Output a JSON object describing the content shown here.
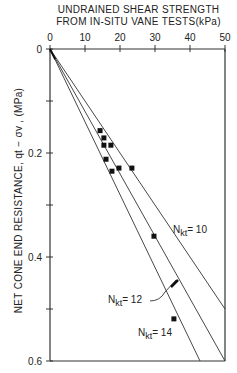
{
  "chart_data": {
    "type": "scatter",
    "title_lines": [
      "UNDRAINED SHEAR STRENGTH",
      "FROM IN-SITU VANE TESTS(kPa)"
    ],
    "xlabel": "UNDRAINED SHEAR STRENGTH FROM IN-SITU VANE TESTS(kPa)",
    "ylabel": "NET CONE END RESISTANCE, qt − σv , (MPa)",
    "x_axis_position": "top",
    "y_inverted": true,
    "xlim": [
      0,
      50
    ],
    "ylim": [
      0,
      0.6
    ],
    "x_ticks": [
      0,
      10,
      20,
      30,
      40,
      50
    ],
    "y_ticks": [
      0,
      0.2,
      0.4,
      0.6
    ],
    "y_tick_labels": [
      "0",
      "0.2",
      "0.4",
      "0.6"
    ],
    "grid": false,
    "series": [
      {
        "name": "Vane test data",
        "type": "scatter",
        "marker": "square",
        "points": [
          {
            "x": 14.3,
            "y": 0.157
          },
          {
            "x": 15.4,
            "y": 0.171
          },
          {
            "x": 15.4,
            "y": 0.185
          },
          {
            "x": 17.4,
            "y": 0.185
          },
          {
            "x": 16.0,
            "y": 0.212
          },
          {
            "x": 17.7,
            "y": 0.235
          },
          {
            "x": 19.7,
            "y": 0.229
          },
          {
            "x": 23.4,
            "y": 0.229
          },
          {
            "x": 29.7,
            "y": 0.36
          },
          {
            "x": 35.4,
            "y": 0.519
          }
        ]
      }
    ],
    "reference_lines": [
      {
        "name": "Nkt = 10",
        "label": "N",
        "sub": "kt",
        "value": "= 10",
        "Nkt": 10
      },
      {
        "name": "Nkt = 12",
        "label": "N",
        "sub": "kt",
        "value": "= 12",
        "Nkt": 12
      },
      {
        "name": "Nkt = 14",
        "label": "N",
        "sub": "kt",
        "value": "= 14",
        "Nkt": 14
      }
    ]
  }
}
